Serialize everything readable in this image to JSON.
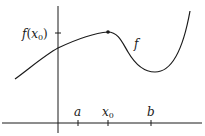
{
  "diagram": {
    "y_axis_label": "f(x0)",
    "y_label_func": "f",
    "y_label_open": "(",
    "y_label_var": "x",
    "y_label_sub": "0",
    "y_label_close": ")",
    "curve_label": "f",
    "x_ticks": [
      {
        "label": "a",
        "sub": ""
      },
      {
        "label": "x",
        "sub": "0"
      },
      {
        "label": "b",
        "sub": ""
      }
    ],
    "colors": {
      "stroke": "#1a1a1a",
      "background": "#ffffff"
    }
  }
}
